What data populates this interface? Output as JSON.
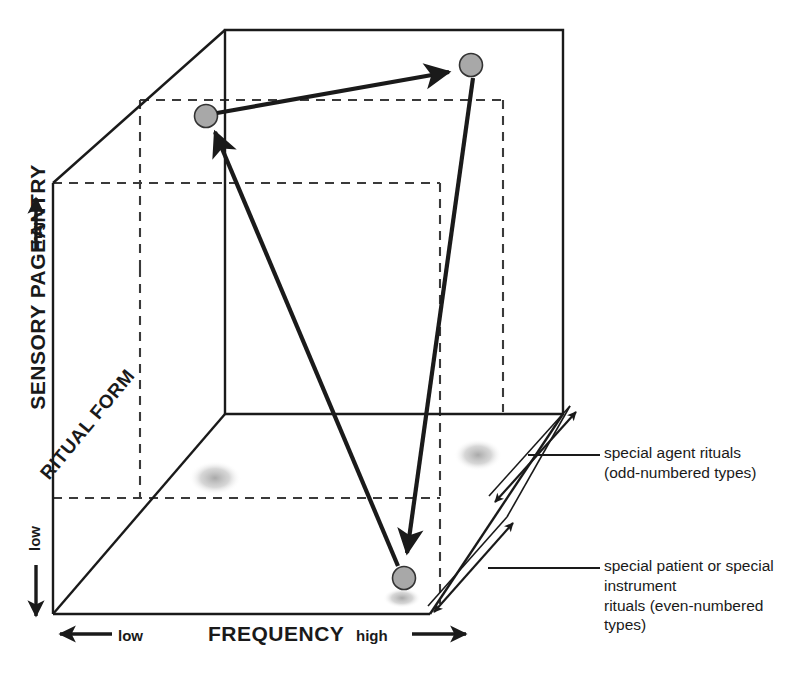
{
  "figure": {
    "type": "3d-cube-scatter-diagram",
    "axes": {
      "y": {
        "title": "SENSORY PAGEANTRY",
        "high_label": "high",
        "low_label": "low"
      },
      "x": {
        "title": "FREQUENCY",
        "low_label": "low",
        "high_label": "high"
      },
      "z": {
        "title": "RITUAL FORM"
      }
    },
    "callouts": [
      {
        "id": "agent",
        "line1": "special agent rituals",
        "line2": "(odd-numbered types)"
      },
      {
        "id": "patient",
        "line1": "special patient or special instrument",
        "line2": "rituals (even-numbered types)"
      }
    ],
    "colors": {
      "stroke": "#1a1a1a",
      "marker_fill": "#a8a8a8",
      "marker_stroke": "#333333",
      "shadow": "#b9b9b9",
      "dashed": "#3a3a3a"
    },
    "markers": [
      {
        "id": "marker-upper-left",
        "x": 206,
        "y": 116,
        "r": 11.5
      },
      {
        "id": "marker-upper-right",
        "x": 471,
        "y": 65,
        "r": 11.5
      },
      {
        "id": "marker-lower",
        "x": 404,
        "y": 578,
        "r": 11.5
      }
    ],
    "arrows": [
      {
        "id": "arrow-left-to-right",
        "from": "marker-upper-left",
        "to": "marker-upper-right"
      },
      {
        "id": "arrow-lower-to-left",
        "from": "marker-lower",
        "to": "marker-upper-left"
      },
      {
        "id": "arrow-right-to-lower",
        "from": "marker-upper-right",
        "to": "marker-lower"
      }
    ],
    "depth_arrows": [
      {
        "id": "depth-arrow-agent"
      },
      {
        "id": "depth-arrow-patient"
      }
    ]
  }
}
